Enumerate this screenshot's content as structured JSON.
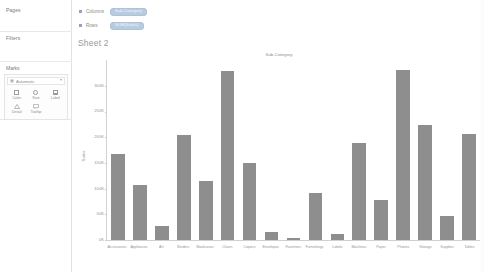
{
  "sidebar": {
    "pages": {
      "label": "Pages"
    },
    "filters": {
      "label": "Filters"
    },
    "marks": {
      "label": "Marks",
      "mark_type": "Automatic",
      "caret": "▾",
      "type_icon": "▦",
      "buttons": [
        {
          "label": "Color",
          "icon": "color-icon"
        },
        {
          "label": "Size",
          "icon": "size-icon"
        },
        {
          "label": "Label",
          "icon": "label-icon"
        },
        {
          "label": "Detail",
          "icon": "detail-icon"
        },
        {
          "label": "Tooltip",
          "icon": "tooltip-icon"
        }
      ]
    }
  },
  "shelves": {
    "columns": {
      "label": "Columns",
      "pill": "Sub-Category"
    },
    "rows": {
      "label": "Rows",
      "pill": "SUM(Sales)"
    }
  },
  "sheet": {
    "title": "Sheet 2"
  },
  "colors": {
    "bar": "#8e8e8e",
    "pill": "#b9cbe0",
    "text": "#8d8d8d",
    "axis": "#cfcfcf"
  },
  "chart_data": {
    "type": "bar",
    "title": "Sub-Category",
    "xlabel": "Sub-Category",
    "ylabel": "Sales",
    "ylim": [
      0,
      350000
    ],
    "grid": false,
    "legend": null,
    "ytick_labels": [
      "0K",
      "50K",
      "100K",
      "150K",
      "200K",
      "250K",
      "300K"
    ],
    "ytick_values": [
      0,
      50000,
      100000,
      150000,
      200000,
      250000,
      300000
    ],
    "categories": [
      "Accessories",
      "Appliances",
      "Art",
      "Binders",
      "Bookcases",
      "Chairs",
      "Copiers",
      "Envelopes",
      "Fasteners",
      "Furnishings",
      "Labels",
      "Machines",
      "Paper",
      "Phones",
      "Storage",
      "Supplies",
      "Tables"
    ],
    "values": [
      167380,
      107532,
      27119,
      203413,
      114880,
      328449,
      149528,
      16476,
      3024,
      91705,
      12486,
      189239,
      78479,
      330007,
      223844,
      46674,
      206966
    ]
  }
}
